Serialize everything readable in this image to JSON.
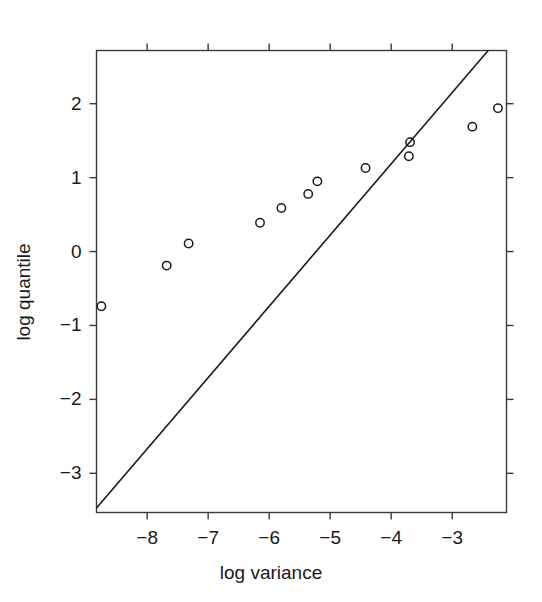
{
  "chart_data": {
    "type": "scatter",
    "title": "",
    "xlabel": "log variance",
    "ylabel": "log quantile",
    "xlim": [
      -8.83,
      -2.11
    ],
    "ylim": [
      -3.53,
      2.72
    ],
    "grid": false,
    "legend": "none",
    "x_ticks": [
      -8,
      -7,
      -6,
      -5,
      -4,
      -3
    ],
    "x_tick_labels": [
      "−8",
      "−7",
      "−6",
      "−5",
      "−4",
      "−3"
    ],
    "y_ticks": [
      -3,
      -2,
      -1,
      0,
      1,
      2
    ],
    "y_tick_labels": [
      "−3",
      "−2",
      "−1",
      "0",
      "1",
      "2"
    ],
    "marker": "open-circle",
    "marker_color": "#1a1a1a",
    "x": [
      -8.75,
      -7.68,
      -7.32,
      -6.15,
      -5.8,
      -5.36,
      -5.21,
      -4.42,
      -3.71,
      -3.69,
      -2.67,
      -2.25
    ],
    "y": [
      -0.74,
      -0.19,
      0.11,
      0.39,
      0.59,
      0.78,
      0.95,
      1.13,
      1.29,
      1.48,
      1.69,
      1.94
    ],
    "points": [
      {
        "x": -8.75,
        "y": -0.74
      },
      {
        "x": -7.68,
        "y": -0.19
      },
      {
        "x": -7.32,
        "y": 0.11
      },
      {
        "x": -6.15,
        "y": 0.39
      },
      {
        "x": -5.8,
        "y": 0.59
      },
      {
        "x": -5.36,
        "y": 0.78
      },
      {
        "x": -5.21,
        "y": 0.95
      },
      {
        "x": -4.42,
        "y": 1.13
      },
      {
        "x": -3.71,
        "y": 1.29
      },
      {
        "x": -3.69,
        "y": 1.48
      },
      {
        "x": -2.67,
        "y": 1.69
      },
      {
        "x": -2.25,
        "y": 1.94
      }
    ],
    "reference_line": {
      "name": "identity-line",
      "type": "line",
      "slope": 1,
      "intercept": 0,
      "color": "#1a1a1a",
      "x_start": -8.83,
      "y_start": -3.47,
      "x_end": -2.41,
      "y_end": 2.72
    }
  },
  "axes": {
    "frame_color": "#3a3a3a",
    "background": "#ffffff"
  }
}
